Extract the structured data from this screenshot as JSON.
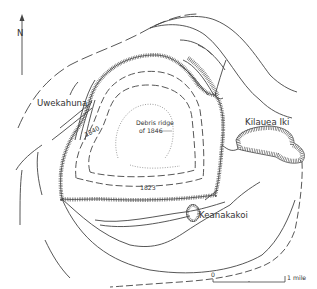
{
  "map": {
    "subject": "Kilauea caldera",
    "north_arrow": {
      "label": "N"
    },
    "labels": {
      "uwekahuna": "Uwekahuna",
      "kilauea_iki": "Kilauea Iki",
      "keanakakoi": "Keanakakoi",
      "debris_ridge_line1": "Debris ridge",
      "debris_ridge_line2": "of 1846",
      "contour_1840": "1840",
      "contour_1823": "1823"
    },
    "scale_bar": {
      "start_label": "0",
      "end_label": "1 mile"
    },
    "colors": {
      "ink": "#444444",
      "background": "#ffffff"
    }
  }
}
